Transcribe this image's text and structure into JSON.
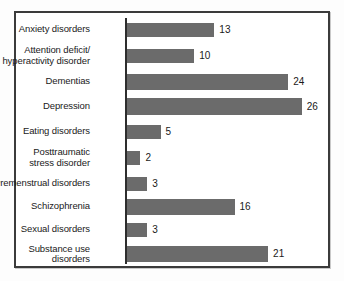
{
  "chart_data": {
    "type": "bar",
    "orientation": "horizontal",
    "title": "",
    "subtitle": "",
    "xlabel": "",
    "ylabel": "",
    "xlim": [
      0,
      26
    ],
    "grid": false,
    "legend": false,
    "bar_color": "#6b6b6b",
    "frame_color": "#3b3b3b",
    "axis_color": "#2e2e2e",
    "text_color": "#1a1a1a",
    "categories": [
      "Anxiety disorders",
      "Attention deficit/\nhyperactivity disorder",
      "Dementias",
      "Depression",
      "Eating disorders",
      "Posttraumatic\nstress disorder",
      "Premenstrual disorders",
      "Schizophrenia",
      "Sexual disorders",
      "Substance use\ndisorders"
    ],
    "values": [
      13,
      10,
      24,
      26,
      5,
      2,
      3,
      16,
      3,
      21
    ],
    "value_labels": [
      "13",
      "10",
      "24",
      "26",
      "5",
      "2",
      "3",
      "16",
      "3",
      "21"
    ]
  },
  "bars": [
    {
      "label": "Anxiety disorders",
      "value": 13,
      "value_label": "13"
    },
    {
      "label": "Attention deficit/\nhyperactivity disorder",
      "value": 10,
      "value_label": "10"
    },
    {
      "label": "Dementias",
      "value": 24,
      "value_label": "24"
    },
    {
      "label": "Depression",
      "value": 26,
      "value_label": "26"
    },
    {
      "label": "Eating disorders",
      "value": 5,
      "value_label": "5"
    },
    {
      "label": "Posttraumatic\nstress disorder",
      "value": 2,
      "value_label": "2"
    },
    {
      "label": "Premenstrual disorders",
      "value": 3,
      "value_label": "3"
    },
    {
      "label": "Schizophrenia",
      "value": 16,
      "value_label": "16"
    },
    {
      "label": "Sexual disorders",
      "value": 3,
      "value_label": "3"
    },
    {
      "label": "Substance use\ndisorders",
      "value": 21,
      "value_label": "21"
    }
  ],
  "layout": {
    "rows": [
      {
        "top": 8,
        "height": 17,
        "bar_height": 14
      },
      {
        "top": 30,
        "height": 25,
        "bar_height": 14
      },
      {
        "top": 60,
        "height": 17,
        "bar_height": 16
      },
      {
        "top": 84,
        "height": 19,
        "bar_height": 17
      },
      {
        "top": 110,
        "height": 17,
        "bar_height": 14
      },
      {
        "top": 132,
        "height": 25,
        "bar_height": 14
      },
      {
        "top": 162,
        "height": 17,
        "bar_height": 14
      },
      {
        "top": 184,
        "height": 19,
        "bar_height": 16
      },
      {
        "top": 208,
        "height": 17,
        "bar_height": 14
      },
      {
        "top": 229,
        "height": 24,
        "bar_height": 16
      }
    ],
    "px_per_unit": 6.72
  }
}
